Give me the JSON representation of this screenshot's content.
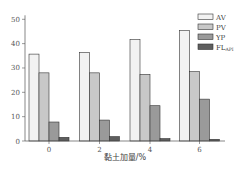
{
  "chart_data": {
    "type": "bar",
    "title": "",
    "xlabel": "黏土加量/%",
    "ylabel": "",
    "categories": [
      "0",
      "2",
      "4",
      "6"
    ],
    "ylim": [
      0,
      50
    ],
    "yticks": [
      0,
      10,
      20,
      30,
      40,
      50
    ],
    "grid": false,
    "legend_position": "top-right",
    "series": [
      {
        "name": "AV",
        "color": "#f2f2f2",
        "values": [
          35.7,
          36.3,
          41.7,
          45.4
        ]
      },
      {
        "name": "PV",
        "color": "#c8c8c8",
        "values": [
          28.0,
          28.0,
          27.4,
          28.5
        ]
      },
      {
        "name": "YP",
        "color": "#9a9a9a",
        "values": [
          7.8,
          8.6,
          14.5,
          17.2
        ]
      },
      {
        "name": "FL",
        "subscript": "API",
        "color": "#5e5e5e",
        "values": [
          1.5,
          1.8,
          1.0,
          0.7
        ]
      }
    ]
  }
}
